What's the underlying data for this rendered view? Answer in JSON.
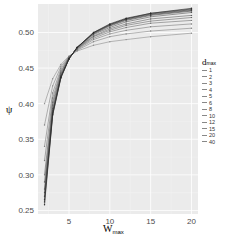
{
  "chart_data": {
    "type": "line",
    "title": "",
    "xlabel": "W",
    "xlabel_sub": "max",
    "ylabel": "ψ",
    "xlim": [
      1.2,
      20.8
    ],
    "ylim": [
      0.245,
      0.54
    ],
    "x_ticks": [
      5,
      10,
      15,
      20
    ],
    "y_ticks": [
      0.25,
      0.3,
      0.35,
      0.4,
      0.45,
      0.5
    ],
    "y_tick_labels": [
      "0.25",
      "0.30",
      "0.35",
      "0.40",
      "0.45",
      "0.50"
    ],
    "grid": true,
    "background": "#ebebeb",
    "legend_title": "d",
    "legend_title_sub": "max",
    "legend_position": "right",
    "x": [
      2,
      3,
      4,
      5,
      6,
      8,
      10,
      12,
      15,
      20
    ],
    "series": [
      {
        "name": "1",
        "values": [
          0.4,
          0.435,
          0.455,
          0.467,
          0.474,
          0.482,
          0.487,
          0.49,
          0.494,
          0.499
        ]
      },
      {
        "name": "2",
        "values": [
          0.37,
          0.425,
          0.452,
          0.466,
          0.475,
          0.487,
          0.494,
          0.498,
          0.502,
          0.506
        ]
      },
      {
        "name": "3",
        "values": [
          0.34,
          0.415,
          0.449,
          0.466,
          0.476,
          0.49,
          0.498,
          0.503,
          0.508,
          0.512
        ]
      },
      {
        "name": "4",
        "values": [
          0.32,
          0.408,
          0.446,
          0.465,
          0.477,
          0.492,
          0.501,
          0.507,
          0.513,
          0.517
        ]
      },
      {
        "name": "5",
        "values": [
          0.3,
          0.402,
          0.444,
          0.465,
          0.477,
          0.494,
          0.503,
          0.51,
          0.516,
          0.521
        ]
      },
      {
        "name": "6",
        "values": [
          0.29,
          0.398,
          0.442,
          0.464,
          0.478,
          0.495,
          0.505,
          0.512,
          0.519,
          0.524
        ]
      },
      {
        "name": "8",
        "values": [
          0.28,
          0.393,
          0.44,
          0.464,
          0.478,
          0.497,
          0.507,
          0.515,
          0.522,
          0.528
        ]
      },
      {
        "name": "10",
        "values": [
          0.275,
          0.39,
          0.439,
          0.463,
          0.479,
          0.498,
          0.509,
          0.517,
          0.524,
          0.53
        ]
      },
      {
        "name": "12",
        "values": [
          0.27,
          0.388,
          0.438,
          0.463,
          0.479,
          0.499,
          0.51,
          0.518,
          0.525,
          0.531
        ]
      },
      {
        "name": "15",
        "values": [
          0.265,
          0.386,
          0.437,
          0.463,
          0.479,
          0.499,
          0.511,
          0.519,
          0.526,
          0.532
        ]
      },
      {
        "name": "20",
        "values": [
          0.262,
          0.385,
          0.437,
          0.463,
          0.479,
          0.5,
          0.511,
          0.519,
          0.527,
          0.533
        ]
      },
      {
        "name": "40",
        "values": [
          0.258,
          0.384,
          0.436,
          0.463,
          0.479,
          0.5,
          0.512,
          0.52,
          0.527,
          0.534
        ]
      }
    ]
  }
}
